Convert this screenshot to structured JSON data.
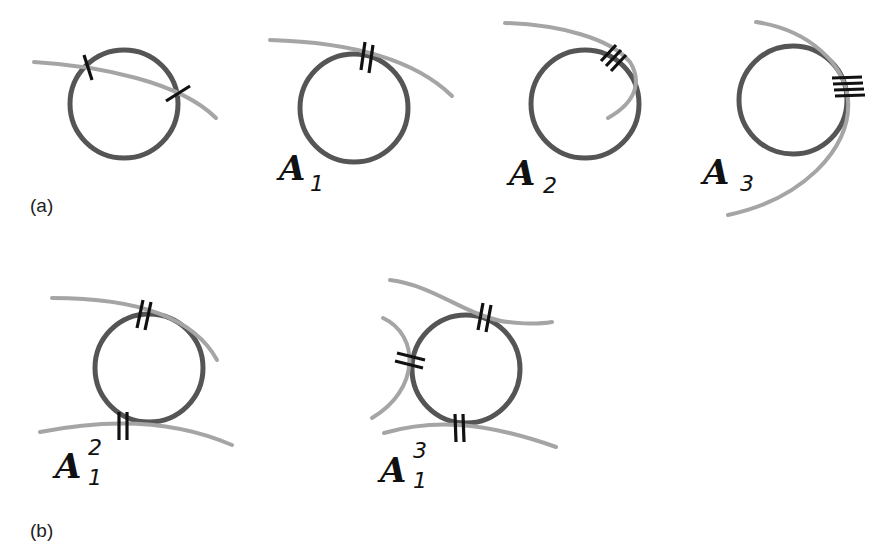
{
  "figure": {
    "panel_a": {
      "label": "(a)",
      "items": [
        {
          "name": "transversal-crossing",
          "label": "",
          "sub": "",
          "sup": ""
        },
        {
          "name": "A1",
          "label": "A",
          "sub": "1",
          "sup": ""
        },
        {
          "name": "A2",
          "label": "A",
          "sub": "2",
          "sup": ""
        },
        {
          "name": "A3",
          "label": "A",
          "sub": "3",
          "sup": ""
        }
      ]
    },
    "panel_b": {
      "label": "(b)",
      "items": [
        {
          "name": "A1^2",
          "label": "A",
          "sub": "1",
          "sup": "2"
        },
        {
          "name": "A1^3",
          "label": "A",
          "sub": "1",
          "sup": "3"
        }
      ]
    },
    "colors": {
      "circle": "#555555",
      "curve": "#a5a5a5",
      "tick_marks": "#111111",
      "background": "#ffffff"
    }
  }
}
